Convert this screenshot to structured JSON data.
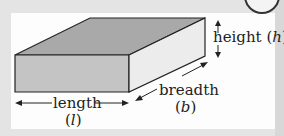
{
  "labels": {
    "height": "height",
    "height_symbol": "h",
    "length": "length",
    "length_symbol": "l",
    "breadth": "breadth",
    "breadth_symbol": "b"
  },
  "colors": {
    "top_face": "#a9a9a9",
    "front_face": "#c4c4c4",
    "side_face": "#ececec",
    "outline": "#222222"
  }
}
